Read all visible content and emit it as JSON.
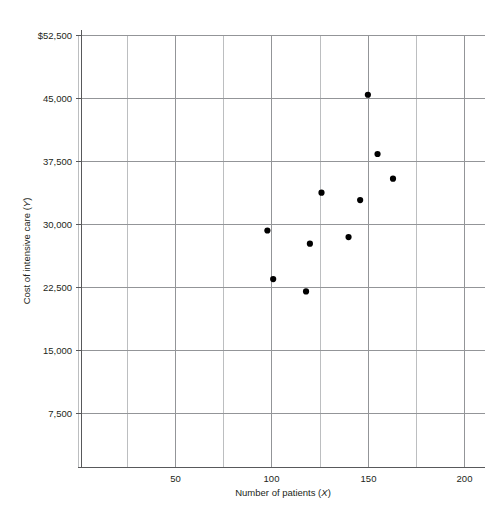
{
  "chart_data": {
    "type": "scatter",
    "title": "",
    "xlabel": "Number of patients (X)",
    "ylabel": "Cost of intensive care (Y)",
    "xlabel_text": "Number of patients (",
    "xlabel_var": "X",
    "xlabel_tail": ")",
    "ylabel_text": "Cost of intensive care (",
    "ylabel_var": "Y",
    "ylabel_tail": ")",
    "xlim": [
      0,
      200
    ],
    "ylim": [
      0,
      52500
    ],
    "xticks": [
      50,
      100,
      150,
      200
    ],
    "xticklabels": [
      "50",
      "100",
      "150",
      "200"
    ],
    "yticks": [
      7500,
      15000,
      22500,
      30000,
      37500,
      45000,
      52500
    ],
    "yticklabels": [
      "7,500",
      "15,000",
      "22,500",
      "30,000",
      "37,500",
      "45,000",
      "$52,500"
    ],
    "grid": true,
    "grid_x_step": 25,
    "grid_y_step": 7500,
    "legend": "none",
    "marker": "filled-circle",
    "marker_color": "#000000",
    "x": [
      98,
      101,
      118,
      120,
      126,
      146,
      150,
      155,
      163,
      146
    ],
    "y": [
      28800,
      22900,
      21400,
      27200,
      33400,
      32500,
      45300,
      38100,
      35100,
      32500
    ],
    "points": [
      {
        "x": 98,
        "y": 28800
      },
      {
        "x": 101,
        "y": 22900
      },
      {
        "x": 118,
        "y": 21400
      },
      {
        "x": 120,
        "y": 27200
      },
      {
        "x": 126,
        "y": 33400
      },
      {
        "x": 140,
        "y": 28000
      },
      {
        "x": 146,
        "y": 32500
      },
      {
        "x": 150,
        "y": 45300
      },
      {
        "x": 155,
        "y": 38100
      },
      {
        "x": 163,
        "y": 35100
      }
    ]
  },
  "axes": {
    "y_axis_name": "cost-axis",
    "x_axis_name": "patients-axis"
  }
}
